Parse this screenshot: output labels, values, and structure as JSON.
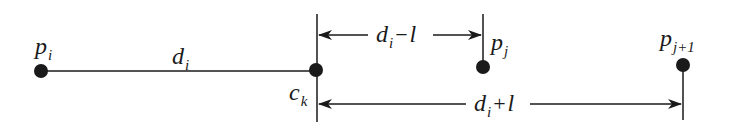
{
  "diagram": {
    "stroke_color": "#1a1a1a",
    "background": "#ffffff",
    "points": [
      {
        "id": "p_i",
        "name": "p",
        "sub": "i",
        "x": 41,
        "y": 71
      },
      {
        "id": "c_k",
        "name": "c",
        "sub": "k",
        "x": 316,
        "y": 70
      },
      {
        "id": "p_j",
        "name": "p",
        "sub": "j",
        "x": 483,
        "y": 67
      },
      {
        "id": "p_j1",
        "name": "p",
        "sub": "j+1",
        "x": 683,
        "y": 65
      }
    ],
    "segments": {
      "main_segment": {
        "from": "p_i",
        "to": "c_k",
        "label_main": "d",
        "label_sub": "i"
      }
    },
    "dimensions": {
      "upper": {
        "from": "c_k",
        "to": "p_j",
        "label_main": "d",
        "label_sub": "i",
        "label_op": "−",
        "label_tail": "l",
        "y": 35
      },
      "lower": {
        "from": "c_k",
        "to": "p_j1",
        "label_main": "d",
        "label_sub": "i",
        "label_op": "+",
        "label_tail": "l",
        "y": 104
      }
    },
    "labels": {
      "p_i": {
        "main": "p",
        "sub": "i"
      },
      "c_k": {
        "main": "c",
        "sub": "k"
      },
      "p_j": {
        "main": "p",
        "sub": "j"
      },
      "p_j1": {
        "main": "p",
        "sub": "j+1"
      },
      "d_i": {
        "main": "d",
        "sub": "i"
      },
      "upper_dim": {
        "main": "d",
        "sub": "i",
        "op": "−",
        "tail": "l"
      },
      "lower_dim": {
        "main": "d",
        "sub": "i",
        "op": "+",
        "tail": "l"
      }
    }
  }
}
